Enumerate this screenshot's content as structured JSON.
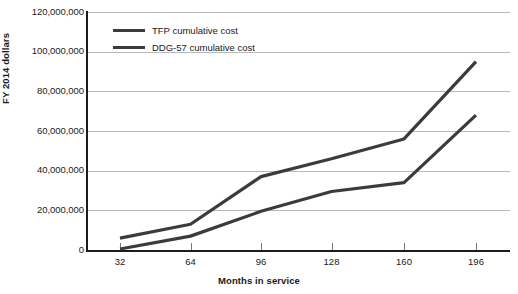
{
  "chart_data": {
    "type": "line",
    "title": "",
    "xlabel": "Months in service",
    "ylabel": "FY 2014 dollars",
    "categories": [
      "32",
      "64",
      "96",
      "128",
      "160",
      "196"
    ],
    "x": [
      32,
      64,
      96,
      128,
      160,
      196
    ],
    "ylim": [
      0,
      120000000
    ],
    "y_ticks": [
      0,
      20000000,
      40000000,
      60000000,
      80000000,
      100000000,
      120000000
    ],
    "y_tick_labels": [
      "0",
      "20,000,000",
      "40,000,000",
      "60,000,000",
      "80,000,000",
      "100,000,000",
      "120,000,000"
    ],
    "grid": "horizontal",
    "legend_position": "top-left-inside",
    "series": [
      {
        "name": "TFP cumulative cost",
        "color": "#3b3b3b",
        "values": [
          6000000,
          13000000,
          37000000,
          46000000,
          56000000,
          95000000
        ]
      },
      {
        "name": "DDG-57 cumulative cost",
        "color": "#3b3b3b",
        "values": [
          500000,
          7000000,
          19500000,
          29500000,
          34000000,
          68000000
        ]
      }
    ]
  },
  "axes": {
    "y_title": "FY 2014 dollars",
    "x_title": "Months in service"
  },
  "legend": {
    "items": [
      {
        "label": "TFP cumulative cost"
      },
      {
        "label": "DDG-57 cumulative cost"
      }
    ]
  },
  "colors": {
    "series_line": "#3b3b3b",
    "axis": "#1c1c1c",
    "gridline": "#b9b9b9",
    "text": "#1a1a1a"
  }
}
